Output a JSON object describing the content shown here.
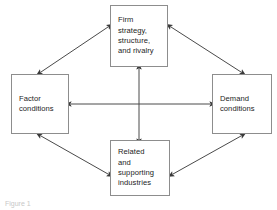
{
  "diagram": {
    "background_color": "#ffffff",
    "line_color": "#4a4a4a",
    "box_border_color": "#8d8d8d",
    "text_color": "#1d1d1d",
    "nodes": [
      {
        "id": "firm-strategy",
        "name": "Firm strategy, structure, and rivalry",
        "lines": [
          "Firm",
          "strategy,",
          "structure,",
          "and rivalry"
        ],
        "position": "top"
      },
      {
        "id": "factor-conditions",
        "name": "Factor conditions",
        "lines": [
          "Factor",
          "conditions"
        ],
        "position": "left"
      },
      {
        "id": "demand-conditions",
        "name": "Demand conditions",
        "lines": [
          "Demand",
          "conditions"
        ],
        "position": "right"
      },
      {
        "id": "related-industries",
        "name": "Related and supporting industries",
        "lines": [
          "Related",
          "and",
          "supporting",
          "industries"
        ],
        "position": "bottom"
      }
    ],
    "connectors": [
      {
        "id": "horizontal",
        "from": "factor-conditions",
        "to": "demand-conditions",
        "style": "double-arrow"
      },
      {
        "id": "vertical",
        "from": "firm-strategy",
        "to": "related-industries",
        "style": "double-arrow"
      },
      {
        "id": "top-left-diagonal",
        "from": "factor-conditions",
        "to": "firm-strategy",
        "style": "double-arrow"
      },
      {
        "id": "top-right-diagonal",
        "from": "demand-conditions",
        "to": "firm-strategy",
        "style": "double-arrow"
      },
      {
        "id": "bottom-left-diagonal",
        "from": "factor-conditions",
        "to": "related-industries",
        "style": "double-arrow"
      },
      {
        "id": "bottom-right-diagonal",
        "from": "demand-conditions",
        "to": "related-industries",
        "style": "double-arrow"
      }
    ],
    "caption": "Figure 1"
  }
}
